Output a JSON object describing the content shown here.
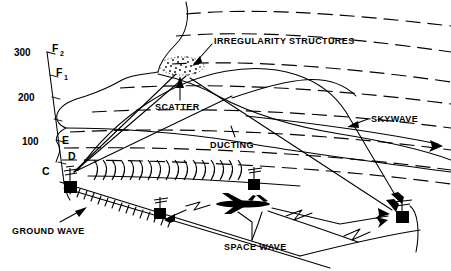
{
  "figure": {
    "background_color": "#ffffff",
    "line_color": "#000000"
  },
  "axis": {
    "name": "altitude-axis",
    "unit_implied": "km",
    "ticks": [
      {
        "label": "300",
        "value": 300
      },
      {
        "label": "200",
        "value": 200
      },
      {
        "label": "100",
        "value": 100
      }
    ],
    "layers": [
      {
        "id": "F2",
        "base": "F",
        "sub": "2"
      },
      {
        "id": "F1",
        "base": "F",
        "sub": "1"
      },
      {
        "id": "E",
        "base": "E",
        "sub": ""
      },
      {
        "id": "D",
        "base": "D",
        "sub": ""
      },
      {
        "id": "C",
        "base": "C",
        "sub": ""
      }
    ]
  },
  "labels": {
    "irregularity_structures": "IRREGULARITY STRUCTURES",
    "scatter": "SCATTER",
    "skywave": "SKYWAVE",
    "ducting": "DUCTING",
    "ground_wave": "GROUND WAVE",
    "space_wave": "SPACE WAVE"
  },
  "objects": {
    "transmitter": "transmitter-station",
    "mid_receiver": "mid-receiver-station",
    "far_receiver": "far-receiver-station",
    "aircraft": "aircraft",
    "scatter_patch": "irregularity-patch"
  }
}
